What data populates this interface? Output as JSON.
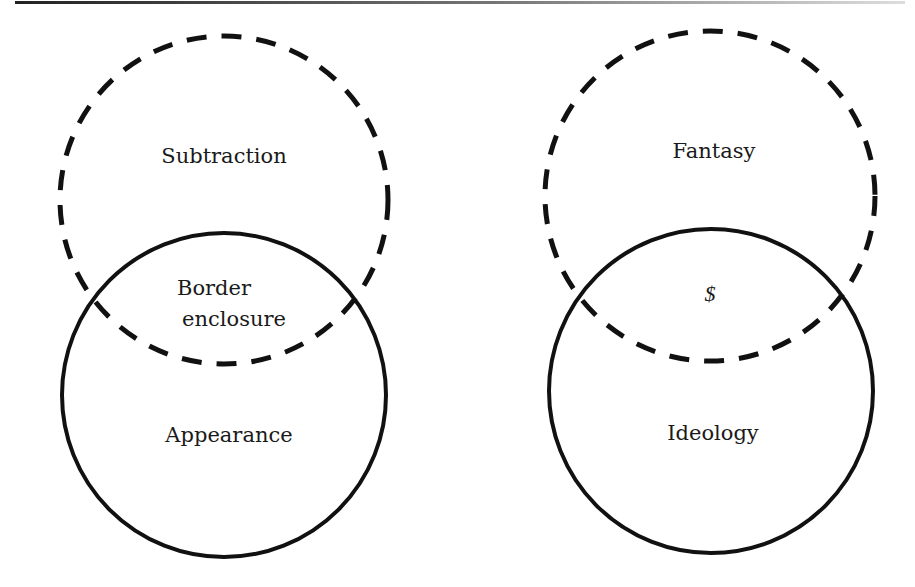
{
  "diagram": {
    "type": "two paired Venn diagrams (dashed circle over solid circle)",
    "colors": {
      "stroke": "#111111",
      "background": "#ffffff",
      "rule": "#333333"
    },
    "left": {
      "dashed_circle": {
        "label": "Subtraction",
        "cx": 224,
        "cy": 200,
        "r": 164
      },
      "solid_circle": {
        "label": "Appearance",
        "cx": 224,
        "cy": 395,
        "r": 162
      },
      "intersection_label_line1": "Border",
      "intersection_label_line2": "enclosure"
    },
    "right": {
      "dashed_circle": {
        "label": "Fantasy",
        "cx": 710,
        "cy": 196,
        "r": 165
      },
      "solid_circle": {
        "label": "Ideology",
        "cx": 711,
        "cy": 391,
        "r": 163
      },
      "intersection_label": "$"
    }
  }
}
